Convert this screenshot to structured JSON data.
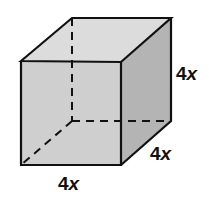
{
  "diagram": {
    "type": "cube",
    "colors": {
      "edge": "#111111",
      "top_face": "#dcdcdc",
      "front_face": "#cfcfcf",
      "side_face": "#b4b4b4",
      "background": "#ffffff"
    },
    "labels": {
      "height": {
        "num": "4",
        "var": "x"
      },
      "depth": {
        "num": "4",
        "var": "x"
      },
      "width": {
        "num": "4",
        "var": "x"
      }
    }
  }
}
